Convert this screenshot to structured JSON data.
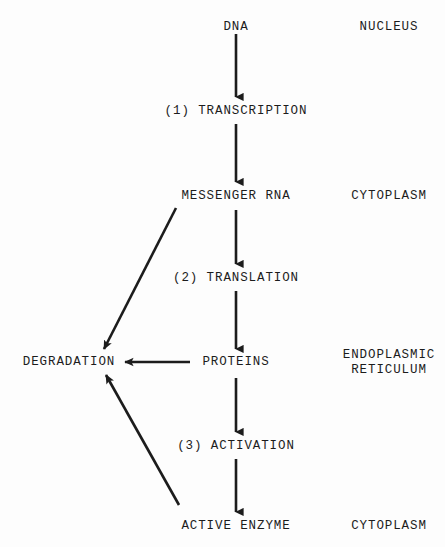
{
  "diagram": {
    "background_color": "#fdfdfd",
    "ink_color": "#1c1c1c",
    "nodes": {
      "dna": "DNA",
      "step1": "(1) TRANSCRIPTION",
      "messenger_rna": "MESSENGER RNA",
      "step2": "(2) TRANSLATION",
      "proteins": "PROTEINS",
      "degradation": "DEGRADATION",
      "step3": "(3) ACTIVATION",
      "active_enzyme": "ACTIVE ENZYME"
    },
    "compartments": {
      "nucleus": "NUCLEUS",
      "cytoplasm_upper": "CYTOPLASM",
      "endoplasmic_reticulum_line1": "ENDOPLASMIC",
      "endoplasmic_reticulum_line2": "RETICULUM",
      "cytoplasm_lower": "CYTOPLASM"
    },
    "edges": [
      {
        "name": "dna-to-transcription",
        "from": "DNA",
        "to": "(1) TRANSCRIPTION",
        "direction": "down"
      },
      {
        "name": "transcription-to-mrna",
        "from": "(1) TRANSCRIPTION",
        "to": "MESSENGER RNA",
        "direction": "down"
      },
      {
        "name": "mrna-to-translation",
        "from": "MESSENGER RNA",
        "to": "(2) TRANSLATION",
        "direction": "down"
      },
      {
        "name": "translation-to-proteins",
        "from": "(2) TRANSLATION",
        "to": "PROTEINS",
        "direction": "down"
      },
      {
        "name": "proteins-to-activation",
        "from": "PROTEINS",
        "to": "(3) ACTIVATION",
        "direction": "down"
      },
      {
        "name": "activation-to-active-enzyme",
        "from": "(3) ACTIVATION",
        "to": "ACTIVE ENZYME",
        "direction": "down"
      },
      {
        "name": "mrna-to-degradation",
        "from": "MESSENGER RNA",
        "to": "DEGRADATION",
        "direction": "diagonal-down-left"
      },
      {
        "name": "proteins-to-degradation",
        "from": "PROTEINS",
        "to": "DEGRADATION",
        "direction": "left"
      },
      {
        "name": "active-enzyme-to-degradation",
        "from": "ACTIVE ENZYME",
        "to": "DEGRADATION",
        "direction": "diagonal-up-left"
      }
    ]
  }
}
